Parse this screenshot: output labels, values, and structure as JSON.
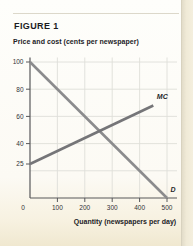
{
  "figure": {
    "label": "FIGURE 1"
  },
  "chart_data": {
    "type": "line",
    "title": "FIGURE 1",
    "xlabel": "Quantity (newspapers per day)",
    "ylabel": "Price and cost (cents per newspaper)",
    "xlim": [
      0,
      500
    ],
    "ylim": [
      0,
      100
    ],
    "x_ticks": [
      0,
      100,
      200,
      300,
      400,
      500
    ],
    "y_ticks": [
      25,
      40,
      60,
      80,
      100
    ],
    "x_gridlines": [
      100,
      200,
      300,
      400,
      500
    ],
    "y_gridlines": [
      20,
      40,
      60,
      80,
      100
    ],
    "grid": true,
    "legend_position": "none",
    "axis_color": "#58585a",
    "grid_color": "#dfdfd9",
    "tick_text_color": "#333336",
    "curve_label_color": "#27272b",
    "series": [
      {
        "name": "demand",
        "label": "D",
        "color": "#8b8b8d",
        "points": [
          [
            0,
            100
          ],
          [
            500,
            0
          ]
        ]
      },
      {
        "name": "marginal-cost",
        "label": "MC",
        "color": "#757578",
        "points": [
          [
            0,
            25
          ],
          [
            450,
            68
          ]
        ]
      }
    ]
  }
}
